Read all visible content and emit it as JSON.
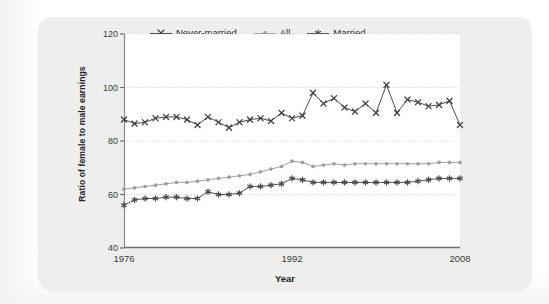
{
  "figure": {
    "ylabel": "Ratio of female to male earnings",
    "xlabel": "Year"
  },
  "legend": {
    "items": [
      {
        "label": "Never-married",
        "marker": "x-marker-icon",
        "color": "#3f3f3f"
      },
      {
        "label": "All",
        "marker": "circle-marker-icon",
        "color": "#a0a0a0"
      },
      {
        "label": "Married",
        "marker": "asterisk-marker-icon",
        "color": "#4a4a4a"
      }
    ]
  },
  "axes": {
    "y_ticks": [
      "120",
      "100",
      "80",
      "60",
      "40"
    ],
    "x_ticks": [
      "1976",
      "1992",
      "2008"
    ]
  },
  "chart_data": {
    "type": "line",
    "title": "",
    "xlabel": "Year",
    "ylabel": "Ratio of female to male earnings",
    "xlim": [
      1976,
      2008
    ],
    "ylim": [
      40,
      120
    ],
    "ytick_values": [
      40,
      60,
      80,
      100,
      120
    ],
    "xtick_values": [
      1976,
      1992,
      2008
    ],
    "grid": "horizontal-dotted",
    "legend_position": "top-center-outside",
    "x": [
      1976,
      1977,
      1978,
      1979,
      1980,
      1981,
      1982,
      1983,
      1984,
      1985,
      1986,
      1987,
      1988,
      1989,
      1990,
      1991,
      1992,
      1993,
      1994,
      1995,
      1996,
      1997,
      1998,
      1999,
      2000,
      2001,
      2002,
      2003,
      2004,
      2005,
      2006,
      2007,
      2008
    ],
    "series": [
      {
        "name": "Never-married",
        "marker": "x",
        "color": "#3f3f3f",
        "values": [
          88.0,
          86.5,
          87.0,
          88.5,
          89.0,
          89.0,
          88.0,
          86.0,
          89.0,
          87.0,
          85.0,
          87.0,
          88.0,
          88.5,
          87.5,
          90.5,
          88.5,
          89.5,
          98.0,
          94.0,
          96.0,
          92.5,
          91.0,
          94.0,
          90.5,
          101.0,
          90.5,
          95.5,
          94.5,
          93.0,
          93.5,
          95.0,
          86.0
        ]
      },
      {
        "name": "All",
        "marker": "circle",
        "color": "#a0a0a0",
        "values": [
          62.0,
          62.5,
          63.0,
          63.5,
          64.0,
          64.5,
          64.5,
          65.0,
          65.5,
          66.0,
          66.5,
          67.0,
          67.5,
          68.5,
          69.5,
          70.5,
          72.5,
          72.0,
          70.5,
          71.0,
          71.5,
          71.0,
          71.5,
          71.5,
          71.5,
          71.5,
          71.5,
          71.5,
          71.5,
          71.5,
          72.0,
          72.0,
          72.0
        ]
      },
      {
        "name": "Married",
        "marker": "asterisk",
        "color": "#4a4a4a",
        "values": [
          56.0,
          58.0,
          58.5,
          58.5,
          59.0,
          59.0,
          58.5,
          58.5,
          61.0,
          60.0,
          60.0,
          60.5,
          63.0,
          63.0,
          63.5,
          64.0,
          66.0,
          65.5,
          64.5,
          64.5,
          64.5,
          64.5,
          64.5,
          64.5,
          64.5,
          64.5,
          64.5,
          64.5,
          65.0,
          65.5,
          66.0,
          66.0,
          66.0
        ]
      }
    ]
  }
}
